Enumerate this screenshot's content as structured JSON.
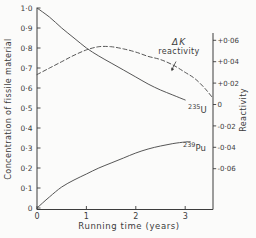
{
  "figure": {
    "ink": "#3c3c3c",
    "line_color": "#4d4d4d",
    "background": "#fbfbfa"
  },
  "chart_data": {
    "type": "line",
    "title": "",
    "grid": false,
    "x_axis": {
      "title": "Running time (years)",
      "tick_labels": [
        "0",
        "1",
        "2",
        "3"
      ],
      "tick_values": [
        0,
        1,
        2,
        3
      ],
      "range": [
        0,
        3.56
      ]
    },
    "left_axis": {
      "title": "Concentration of fissile material",
      "tick_labels": [
        "0",
        "0·1",
        "0·2",
        "0·3",
        "0·4",
        "0·5",
        "0·6",
        "0·7",
        "0·8",
        "0·9",
        "1·0"
      ],
      "tick_values": [
        0,
        0.1,
        0.2,
        0.3,
        0.4,
        0.5,
        0.6,
        0.7,
        0.8,
        0.9,
        1.0
      ],
      "range": [
        0,
        1.0
      ]
    },
    "right_axis": {
      "title": "Reactivity",
      "tick_labels": [
        "+0·06",
        "+0·04",
        "+0·02",
        "0",
        "-0·02",
        "-0·04",
        "-0·06"
      ],
      "tick_values": [
        0.06,
        0.04,
        0.02,
        0,
        -0.02,
        -0.04,
        -0.06
      ],
      "range": [
        -0.097,
        0.067
      ]
    },
    "annotation": {
      "line1": "ΔK",
      "line2": "reactivity"
    },
    "series": [
      {
        "name": "U-235 concentration",
        "label_mass": "235",
        "label_symbol": "U",
        "axis": "left",
        "line": "solid",
        "points": [
          [
            0,
            1.0
          ],
          [
            0.25,
            0.955
          ],
          [
            0.5,
            0.9
          ],
          [
            0.75,
            0.85
          ],
          [
            1,
            0.8
          ],
          [
            1.25,
            0.76
          ],
          [
            1.5,
            0.725
          ],
          [
            1.75,
            0.69
          ],
          [
            2,
            0.655
          ],
          [
            2.25,
            0.62
          ],
          [
            2.5,
            0.59
          ],
          [
            2.75,
            0.565
          ],
          [
            3,
            0.54
          ]
        ]
      },
      {
        "name": "Pu-239 concentration",
        "label_mass": "239",
        "label_symbol": "Pu",
        "axis": "left",
        "line": "solid",
        "points": [
          [
            0,
            0
          ],
          [
            0.25,
            0.055
          ],
          [
            0.5,
            0.105
          ],
          [
            0.75,
            0.14
          ],
          [
            1,
            0.17
          ],
          [
            1.25,
            0.2
          ],
          [
            1.5,
            0.225
          ],
          [
            1.75,
            0.25
          ],
          [
            2,
            0.275
          ],
          [
            2.25,
            0.295
          ],
          [
            2.5,
            0.31
          ],
          [
            2.75,
            0.322
          ],
          [
            3,
            0.33
          ],
          [
            3.1,
            0.332
          ]
        ]
      },
      {
        "name": "ΔK reactivity",
        "axis": "right",
        "line": "dashed",
        "points": [
          [
            0,
            0.028
          ],
          [
            0.25,
            0.034
          ],
          [
            0.5,
            0.04
          ],
          [
            0.75,
            0.046
          ],
          [
            1,
            0.051
          ],
          [
            1.25,
            0.054
          ],
          [
            1.5,
            0.054
          ],
          [
            1.75,
            0.052
          ],
          [
            2,
            0.049
          ],
          [
            2.25,
            0.045
          ],
          [
            2.5,
            0.042
          ],
          [
            2.75,
            0.037
          ],
          [
            3,
            0.03
          ],
          [
            3.2,
            0.024
          ],
          [
            3.4,
            0.015
          ],
          [
            3.56,
            0.006
          ]
        ]
      }
    ]
  }
}
